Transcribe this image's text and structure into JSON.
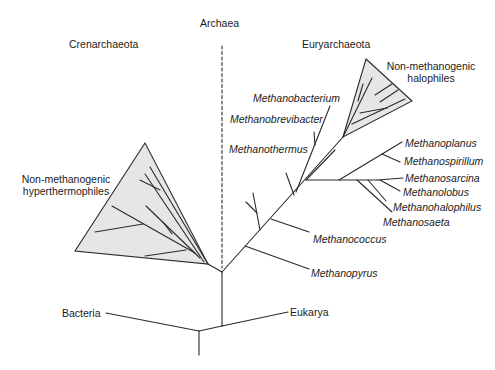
{
  "diagram": {
    "type": "phylogenetic-tree",
    "domain_label": "Archaea",
    "groups": {
      "crenarchaeota": "Crenarchaeota",
      "euryarchaeota": "Euryarchaeota"
    },
    "clades": {
      "hyperthermophiles_line1": "Non-methanogenic",
      "hyperthermophiles_line2": "hyperthermophiles",
      "halophiles_line1": "Non-methanogenic",
      "halophiles_line2": "halophiles"
    },
    "outgroups": {
      "bacteria": "Bacteria",
      "eukarya": "Eukarya"
    },
    "taxa": [
      "Methanobacterium",
      "Methanobrevibacter",
      "Methanothermus",
      "Methanoplanus",
      "Methanospirillum",
      "Methanosarcina",
      "Methanolobus",
      "Methanohalophilus",
      "Methanosaeta",
      "Methanococcus",
      "Methanopyrus"
    ],
    "colors": {
      "line": "#2a2a2a",
      "triangle_fill": "#e6e6e6"
    }
  }
}
